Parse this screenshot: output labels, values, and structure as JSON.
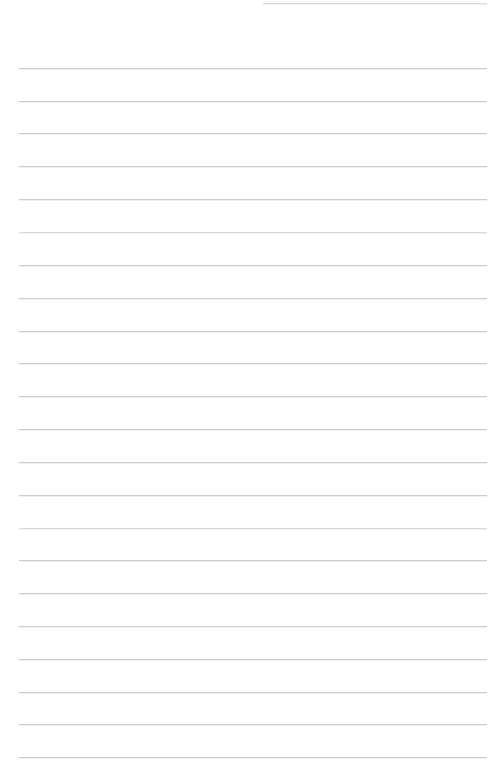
{
  "page": {
    "kind": "lined-notebook-paper",
    "width": 500,
    "height": 776,
    "background_color": "#ffffff",
    "rule_color": "#c9ccd1",
    "rule_faint_color": "#d5d8dc",
    "content_text": "",
    "has_text": false
  },
  "rules": {
    "left_margin": 19,
    "right_margin": 487,
    "line_spacing": 32.8,
    "first_line_y": 68,
    "full_line_count": 22,
    "partial_line": {
      "y": 3,
      "left": 263,
      "right": 487
    },
    "lines": [
      {
        "y": 3,
        "left": 263,
        "right": 487,
        "faint": false,
        "partial": true
      },
      {
        "y": 68,
        "left": 19,
        "right": 487,
        "faint": false,
        "partial": false
      },
      {
        "y": 101,
        "left": 19,
        "right": 487,
        "faint": false,
        "partial": false
      },
      {
        "y": 133,
        "left": 19,
        "right": 487,
        "faint": false,
        "partial": false
      },
      {
        "y": 166,
        "left": 19,
        "right": 487,
        "faint": false,
        "partial": false
      },
      {
        "y": 199,
        "left": 19,
        "right": 487,
        "faint": false,
        "partial": false
      },
      {
        "y": 232,
        "left": 19,
        "right": 487,
        "faint": true,
        "partial": false
      },
      {
        "y": 265,
        "left": 19,
        "right": 487,
        "faint": false,
        "partial": false
      },
      {
        "y": 298,
        "left": 19,
        "right": 487,
        "faint": false,
        "partial": false
      },
      {
        "y": 331,
        "left": 19,
        "right": 487,
        "faint": false,
        "partial": false
      },
      {
        "y": 363,
        "left": 19,
        "right": 487,
        "faint": false,
        "partial": false
      },
      {
        "y": 396,
        "left": 19,
        "right": 487,
        "faint": false,
        "partial": false
      },
      {
        "y": 429,
        "left": 19,
        "right": 487,
        "faint": false,
        "partial": false
      },
      {
        "y": 462,
        "left": 19,
        "right": 487,
        "faint": false,
        "partial": false
      },
      {
        "y": 495,
        "left": 19,
        "right": 487,
        "faint": false,
        "partial": false
      },
      {
        "y": 528,
        "left": 19,
        "right": 487,
        "faint": true,
        "partial": false
      },
      {
        "y": 560,
        "left": 19,
        "right": 487,
        "faint": false,
        "partial": false
      },
      {
        "y": 593,
        "left": 19,
        "right": 487,
        "faint": false,
        "partial": false
      },
      {
        "y": 626,
        "left": 19,
        "right": 487,
        "faint": false,
        "partial": false
      },
      {
        "y": 659,
        "left": 19,
        "right": 487,
        "faint": false,
        "partial": false
      },
      {
        "y": 692,
        "left": 19,
        "right": 487,
        "faint": false,
        "partial": false
      },
      {
        "y": 724,
        "left": 19,
        "right": 487,
        "faint": false,
        "partial": false
      },
      {
        "y": 757,
        "left": 19,
        "right": 487,
        "faint": false,
        "partial": false
      }
    ]
  }
}
